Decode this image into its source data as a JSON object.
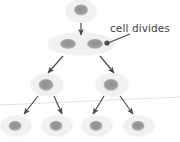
{
  "figure": {
    "background": "#ffffff"
  },
  "annotations": [
    {
      "id": "cell-divides",
      "text": "cell divides",
      "x": 110,
      "y": 23,
      "color": "#3f3f3f",
      "leader": {
        "from_x": 130,
        "from_y": 34,
        "to_x": 108,
        "to_y": 43,
        "dot_x": 107,
        "dot_y": 43
      }
    }
  ],
  "colors": {
    "cell_body": "#f1f1f1",
    "cell_body_edge": "#ebebeb",
    "nucleus": "#9c9c9c",
    "arrow": "#4a4a4a",
    "guide_line": "#e0e0e0",
    "text": "#3f3f3f"
  },
  "cells": [
    {
      "id": "gen0-cell",
      "generation": 0,
      "cx": 81,
      "cy": 11,
      "rx": 15,
      "ry": 11,
      "nuclei": [
        {
          "cx": 81,
          "cy": 10,
          "rx": 7,
          "ry": 5.5
        }
      ]
    },
    {
      "id": "gen1-dividing-cell",
      "generation": 1,
      "cx": 81,
      "cy": 44,
      "rx": 33,
      "ry": 11,
      "dividing": true,
      "nuclei": [
        {
          "cx": 68,
          "cy": 44,
          "rx": 8,
          "ry": 5
        },
        {
          "cx": 95,
          "cy": 44,
          "rx": 8,
          "ry": 5
        }
      ]
    },
    {
      "id": "gen2-cell-left",
      "generation": 2,
      "cx": 47,
      "cy": 85,
      "rx": 16,
      "ry": 11,
      "nuclei": [
        {
          "cx": 46,
          "cy": 85,
          "rx": 7.5,
          "ry": 6
        }
      ]
    },
    {
      "id": "gen2-cell-right",
      "generation": 2,
      "cx": 112,
      "cy": 85,
      "rx": 16,
      "ry": 11,
      "nuclei": [
        {
          "cx": 111,
          "cy": 85,
          "rx": 7.5,
          "ry": 6
        }
      ]
    },
    {
      "id": "gen3-cell-1",
      "generation": 3,
      "cx": 16,
      "cy": 126,
      "rx": 15,
      "ry": 10,
      "nuclei": [
        {
          "cx": 15,
          "cy": 126,
          "rx": 6.5,
          "ry": 5
        }
      ]
    },
    {
      "id": "gen3-cell-2",
      "generation": 3,
      "cx": 57,
      "cy": 126,
      "rx": 15,
      "ry": 10,
      "nuclei": [
        {
          "cx": 56,
          "cy": 126,
          "rx": 6.5,
          "ry": 5
        }
      ]
    },
    {
      "id": "gen3-cell-3",
      "generation": 3,
      "cx": 97,
      "cy": 126,
      "rx": 15,
      "ry": 10,
      "nuclei": [
        {
          "cx": 96,
          "cy": 126,
          "rx": 6.5,
          "ry": 5
        }
      ]
    },
    {
      "id": "gen3-cell-4",
      "generation": 3,
      "cx": 139,
      "cy": 126,
      "rx": 15,
      "ry": 10,
      "nuclei": [
        {
          "cx": 138,
          "cy": 126,
          "rx": 6.5,
          "ry": 5
        }
      ]
    }
  ],
  "arrows": [
    {
      "id": "arrow-gen0-to-gen1",
      "x1": 81,
      "y1": 23,
      "x2": 81,
      "y2": 35
    },
    {
      "id": "arrow-gen1-to-gen2-left",
      "x1": 63,
      "y1": 56,
      "x2": 48,
      "y2": 73
    },
    {
      "id": "arrow-gen1-to-gen2-right",
      "x1": 100,
      "y1": 56,
      "x2": 114,
      "y2": 73
    },
    {
      "id": "arrow-gen2-left-to-gen3-1",
      "x1": 38,
      "y1": 96,
      "x2": 24,
      "y2": 114
    },
    {
      "id": "arrow-gen2-left-to-gen3-2",
      "x1": 54,
      "y1": 96,
      "x2": 62,
      "y2": 114
    },
    {
      "id": "arrow-gen2-right-to-gen3-3",
      "x1": 104,
      "y1": 96,
      "x2": 93,
      "y2": 114
    },
    {
      "id": "arrow-gen2-right-to-gen3-4",
      "x1": 120,
      "y1": 96,
      "x2": 133,
      "y2": 114
    }
  ],
  "guide_line": {
    "id": "horizon-line",
    "x1": 0,
    "y1": 105,
    "x2": 180,
    "y2": 97
  }
}
